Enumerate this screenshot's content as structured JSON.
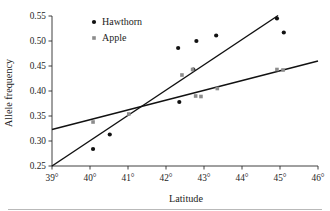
{
  "figure": {
    "background": "#ffffff",
    "footer_rule_color": "#b9b9b9"
  },
  "chart_data": {
    "type": "scatter",
    "title": "",
    "xlabel": "Latitude",
    "ylabel": "Allele frequency",
    "xlim": [
      39,
      46
    ],
    "ylim": [
      0.25,
      0.55
    ],
    "xticks": [
      39,
      40,
      41,
      42,
      43,
      44,
      45,
      46
    ],
    "xtick_labels": [
      "39°",
      "40°",
      "41°",
      "42°",
      "43°",
      "44°",
      "45°",
      "46°"
    ],
    "yticks": [
      0.25,
      0.3,
      0.35,
      0.4,
      0.45,
      0.5,
      0.55
    ],
    "ytick_labels": [
      "0.25",
      "0.30",
      "0.35",
      "0.40",
      "0.45",
      "0.50",
      "0.55"
    ],
    "grid": false,
    "legend_position": "top-left",
    "series": [
      {
        "name": "Hawthorn",
        "marker": "circle",
        "color": "#111111",
        "marker_size": 4.2,
        "points": [
          {
            "x": 40.08,
            "y": 0.284
          },
          {
            "x": 40.52,
            "y": 0.313
          },
          {
            "x": 42.32,
            "y": 0.486
          },
          {
            "x": 42.35,
            "y": 0.378
          },
          {
            "x": 42.72,
            "y": 0.443
          },
          {
            "x": 42.8,
            "y": 0.5
          },
          {
            "x": 43.32,
            "y": 0.511
          },
          {
            "x": 44.92,
            "y": 0.545
          },
          {
            "x": 45.1,
            "y": 0.517
          }
        ],
        "trend": {
          "x1": 39.0,
          "y1": 0.25,
          "x2": 44.95,
          "y2": 0.551
        }
      },
      {
        "name": "Apple",
        "marker": "square",
        "color": "#8c8c8c",
        "marker_size": 3.6,
        "points": [
          {
            "x": 40.08,
            "y": 0.338
          },
          {
            "x": 41.02,
            "y": 0.354
          },
          {
            "x": 42.42,
            "y": 0.432
          },
          {
            "x": 42.7,
            "y": 0.443
          },
          {
            "x": 42.78,
            "y": 0.39
          },
          {
            "x": 42.92,
            "y": 0.389
          },
          {
            "x": 43.35,
            "y": 0.405
          },
          {
            "x": 44.92,
            "y": 0.443
          },
          {
            "x": 45.08,
            "y": 0.442
          }
        ],
        "trend": {
          "x1": 39.0,
          "y1": 0.323,
          "x2": 46.0,
          "y2": 0.46
        }
      }
    ]
  },
  "legend": {
    "items": [
      {
        "label": "Hawthorn",
        "color": "#111111",
        "marker": "circle"
      },
      {
        "label": "Apple",
        "color": "#8c8c8c",
        "marker": "square"
      }
    ]
  }
}
